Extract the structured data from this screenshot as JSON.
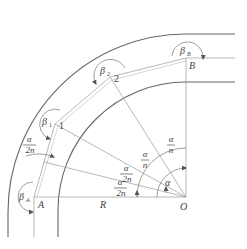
{
  "diagram": {
    "points": {
      "A": {
        "label": "A",
        "x": 34,
        "y": 197
      },
      "B": {
        "label": "B",
        "x": 186,
        "y": 58
      },
      "O": {
        "label": "O",
        "x": 186,
        "y": 197
      },
      "P1": {
        "label": "1",
        "x": 55,
        "y": 124
      },
      "P2": {
        "label": "2",
        "x": 110,
        "y": 77
      }
    },
    "angle_labels": {
      "beta_A": {
        "main": "β",
        "sub": "A"
      },
      "beta_1": {
        "main": "β",
        "sub": "1"
      },
      "beta_2": {
        "main": "β",
        "sub": "2"
      },
      "beta_B": {
        "main": "β",
        "sub": "B"
      },
      "alpha": "α"
    },
    "fractions": {
      "alpha_over_2n_left": {
        "num": "α",
        "den": "2n"
      },
      "alpha_over_2n_center_top": {
        "num": "α",
        "den": "2n"
      },
      "alpha_over_2n_center_bottom": {
        "num": "α",
        "den": "2n"
      },
      "alpha_over_n_1": {
        "num": "α",
        "den": "n"
      },
      "alpha_over_n_2": {
        "num": "α",
        "den": "n"
      }
    },
    "radius_label": "R"
  }
}
